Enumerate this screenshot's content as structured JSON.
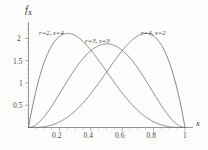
{
  "chart_data": {
    "type": "line",
    "title": "",
    "subtitle": "",
    "xlabel": "x",
    "ylabel": "f_X",
    "xlim": [
      0,
      1.06
    ],
    "ylim": [
      0,
      2.35
    ],
    "grid": false,
    "legend_position": "inline-annotations",
    "xticks": [
      0.2,
      0.4,
      0.6,
      0.8,
      1
    ],
    "xtick_labels": [
      "0.2",
      "0.4",
      "0.6",
      "0.8",
      "1"
    ],
    "yticks": [
      0.5,
      1,
      1.5,
      2
    ],
    "ytick_labels": [
      "0.5",
      "1",
      "1.5",
      "2"
    ],
    "x": [
      0,
      0.05,
      0.1,
      0.15,
      0.2,
      0.25,
      0.3,
      0.35,
      0.4,
      0.45,
      0.5,
      0.55,
      0.6,
      0.65,
      0.7,
      0.75,
      0.8,
      0.85,
      0.9,
      0.95,
      1
    ],
    "series": [
      {
        "name": "r=2, s=4",
        "label": "r=2, s=4",
        "color": "#6f6f6f",
        "peak_x": 0.25,
        "peak_y": 2.11,
        "values": [
          0,
          0.857,
          1.458,
          1.842,
          2.048,
          2.109,
          2.058,
          1.926,
          1.728,
          1.497,
          1.25,
          1.002,
          0.768,
          0.558,
          0.38,
          0.234,
          0.128,
          0.057,
          0.02,
          0.002,
          0
        ]
      },
      {
        "name": "r=3, s=3",
        "label": "r=3, s=3",
        "color": "#6f6f6f",
        "peak_x": 0.5,
        "peak_y": 1.875,
        "values": [
          0,
          0.068,
          0.243,
          0.488,
          0.768,
          1.055,
          1.323,
          1.552,
          1.728,
          1.838,
          1.875,
          1.838,
          1.728,
          1.552,
          1.323,
          1.055,
          0.768,
          0.488,
          0.243,
          0.068,
          0
        ]
      },
      {
        "name": "r=4, s=2",
        "label": "r=4, s=2",
        "color": "#6f6f6f",
        "peak_x": 0.75,
        "peak_y": 2.11,
        "values": [
          0,
          0.002,
          0.02,
          0.057,
          0.128,
          0.234,
          0.38,
          0.558,
          0.768,
          1.002,
          1.25,
          1.497,
          1.728,
          1.926,
          2.058,
          2.109,
          2.048,
          1.842,
          1.458,
          0.857,
          0
        ]
      }
    ],
    "annotations": [
      {
        "text": "r=2, s=4",
        "x": 0.2,
        "y": 2.25
      },
      {
        "text": "r=3, s=3",
        "x": 0.5,
        "y": 2.02
      },
      {
        "text": "r=4, s=2",
        "x": 0.78,
        "y": 2.25
      }
    ]
  },
  "axes": {
    "y_axis_label": "f",
    "y_axis_subscript": "X",
    "x_axis_label": "x"
  },
  "labels": {
    "curve1": "r=2, s=4",
    "curve2": "r=3, s=3",
    "curve3": "r=4, s=2",
    "ytick_2": "2",
    "ytick_15": "1.5",
    "ytick_1": "1",
    "ytick_05": "0.5",
    "xtick_02": "0.2",
    "xtick_04": "0.4",
    "xtick_06": "0.6",
    "xtick_08": "0.8",
    "xtick_1": "1"
  }
}
